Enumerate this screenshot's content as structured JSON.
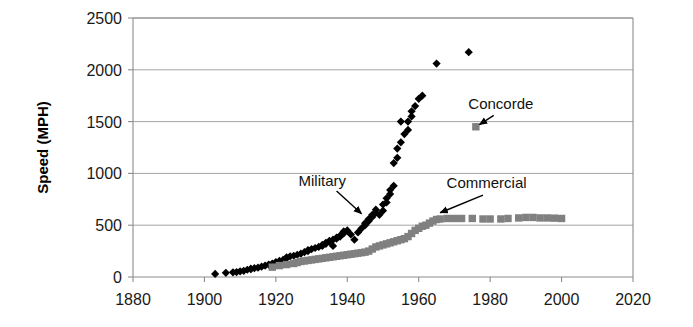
{
  "chart_data": {
    "type": "scatter",
    "title": "",
    "xlabel": "",
    "ylabel": "Speed (MPH)",
    "xlim": [
      1880,
      2020
    ],
    "ylim": [
      0,
      2500
    ],
    "xticks": [
      1880,
      1900,
      1920,
      1940,
      1960,
      1980,
      2000,
      2020
    ],
    "yticks": [
      0,
      500,
      1000,
      1500,
      2000,
      2500
    ],
    "xtick_labels": [
      "1880",
      "1900",
      "1920",
      "1940",
      "1960",
      "1980",
      "2000",
      "2020"
    ],
    "ytick_labels": [
      "0",
      "500",
      "1000",
      "1500",
      "2000",
      "2500"
    ],
    "grid": "horizontal",
    "legend": "none",
    "series": [
      {
        "name": "Military",
        "marker": "diamond",
        "color": "#000000",
        "points": [
          [
            1903,
            30
          ],
          [
            1906,
            40
          ],
          [
            1908,
            45
          ],
          [
            1909,
            48
          ],
          [
            1910,
            55
          ],
          [
            1911,
            60
          ],
          [
            1912,
            70
          ],
          [
            1913,
            75
          ],
          [
            1913,
            80
          ],
          [
            1914,
            85
          ],
          [
            1915,
            90
          ],
          [
            1916,
            100
          ],
          [
            1917,
            110
          ],
          [
            1918,
            120
          ],
          [
            1919,
            130
          ],
          [
            1920,
            145
          ],
          [
            1921,
            155
          ],
          [
            1922,
            165
          ],
          [
            1923,
            180
          ],
          [
            1923,
            190
          ],
          [
            1924,
            200
          ],
          [
            1925,
            205
          ],
          [
            1926,
            215
          ],
          [
            1927,
            225
          ],
          [
            1928,
            240
          ],
          [
            1929,
            250
          ],
          [
            1929,
            260
          ],
          [
            1930,
            270
          ],
          [
            1931,
            280
          ],
          [
            1932,
            290
          ],
          [
            1933,
            300
          ],
          [
            1933,
            310
          ],
          [
            1934,
            320
          ],
          [
            1934,
            330
          ],
          [
            1935,
            340
          ],
          [
            1935,
            350
          ],
          [
            1936,
            360
          ],
          [
            1936,
            300
          ],
          [
            1937,
            370
          ],
          [
            1937,
            380
          ],
          [
            1938,
            390
          ],
          [
            1938,
            400
          ],
          [
            1939,
            420
          ],
          [
            1939,
            440
          ],
          [
            1940,
            450
          ],
          [
            1941,
            410
          ],
          [
            1942,
            360
          ],
          [
            1943,
            430
          ],
          [
            1944,
            470
          ],
          [
            1945,
            500
          ],
          [
            1945,
            520
          ],
          [
            1946,
            540
          ],
          [
            1946,
            560
          ],
          [
            1947,
            580
          ],
          [
            1947,
            600
          ],
          [
            1948,
            620
          ],
          [
            1948,
            650
          ],
          [
            1949,
            600
          ],
          [
            1950,
            640
          ],
          [
            1950,
            700
          ],
          [
            1951,
            720
          ],
          [
            1951,
            760
          ],
          [
            1952,
            800
          ],
          [
            1952,
            840
          ],
          [
            1953,
            880
          ],
          [
            1953,
            1100
          ],
          [
            1954,
            1150
          ],
          [
            1954,
            1240
          ],
          [
            1955,
            1300
          ],
          [
            1955,
            1500
          ],
          [
            1956,
            1380
          ],
          [
            1957,
            1420
          ],
          [
            1957,
            1500
          ],
          [
            1958,
            1550
          ],
          [
            1958,
            1600
          ],
          [
            1959,
            1650
          ],
          [
            1960,
            1720
          ],
          [
            1961,
            1750
          ],
          [
            1965,
            2060
          ],
          [
            1974,
            2170
          ]
        ]
      },
      {
        "name": "Commercial",
        "marker": "square",
        "color": "#808080",
        "points": [
          [
            1919,
            95
          ],
          [
            1921,
            110
          ],
          [
            1923,
            120
          ],
          [
            1925,
            130
          ],
          [
            1926,
            140
          ],
          [
            1927,
            150
          ],
          [
            1928,
            155
          ],
          [
            1929,
            160
          ],
          [
            1930,
            165
          ],
          [
            1931,
            170
          ],
          [
            1932,
            175
          ],
          [
            1933,
            180
          ],
          [
            1934,
            185
          ],
          [
            1935,
            190
          ],
          [
            1936,
            195
          ],
          [
            1937,
            200
          ],
          [
            1938,
            205
          ],
          [
            1939,
            210
          ],
          [
            1940,
            215
          ],
          [
            1941,
            220
          ],
          [
            1942,
            225
          ],
          [
            1943,
            230
          ],
          [
            1944,
            235
          ],
          [
            1945,
            240
          ],
          [
            1946,
            250
          ],
          [
            1947,
            270
          ],
          [
            1948,
            290
          ],
          [
            1949,
            300
          ],
          [
            1950,
            310
          ],
          [
            1951,
            320
          ],
          [
            1952,
            330
          ],
          [
            1953,
            340
          ],
          [
            1954,
            350
          ],
          [
            1955,
            360
          ],
          [
            1956,
            370
          ],
          [
            1957,
            390
          ],
          [
            1958,
            420
          ],
          [
            1959,
            450
          ],
          [
            1960,
            470
          ],
          [
            1961,
            490
          ],
          [
            1962,
            500
          ],
          [
            1963,
            520
          ],
          [
            1964,
            540
          ],
          [
            1965,
            555
          ],
          [
            1966,
            560
          ],
          [
            1968,
            565
          ],
          [
            1970,
            565
          ],
          [
            1972,
            565
          ],
          [
            1975,
            565
          ],
          [
            1978,
            560
          ],
          [
            1980,
            560
          ],
          [
            1983,
            560
          ],
          [
            1985,
            565
          ],
          [
            1988,
            570
          ],
          [
            1990,
            575
          ],
          [
            1992,
            575
          ],
          [
            1994,
            570
          ],
          [
            1996,
            570
          ],
          [
            1998,
            568
          ],
          [
            2000,
            565
          ]
        ]
      },
      {
        "name": "Concorde",
        "marker": "square",
        "color": "#808080",
        "points": [
          [
            1976,
            1450
          ]
        ]
      }
    ],
    "annotations": [
      {
        "label": "Military",
        "text_x": 1933,
        "text_y": 880,
        "arrow_from": [
          1937,
          830
        ],
        "arrow_to": [
          1944,
          610
        ]
      },
      {
        "label": "Concorde",
        "text_x": 1983,
        "text_y": 1620,
        "arrow_from": [
          1981,
          1560
        ],
        "arrow_to": [
          1977,
          1470
        ]
      },
      {
        "label": "Commercial",
        "text_x": 1979,
        "text_y": 860,
        "arrow_from": [
          1978,
          790
        ],
        "arrow_to": [
          1966,
          620
        ]
      }
    ]
  },
  "axes": {
    "y_axis_title": "Speed (MPH)"
  }
}
